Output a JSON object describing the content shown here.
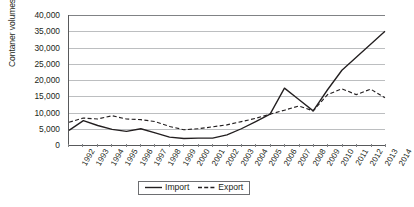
{
  "chart_data": {
    "type": "line",
    "title": "",
    "subtitle": "",
    "xlabel": "",
    "ylabel": "Contaner volumes in TEUs",
    "categories": [
      "1992",
      "1993",
      "1994",
      "1995",
      "1996",
      "1997",
      "1998",
      "1999",
      "2000",
      "2001",
      "2002",
      "2003",
      "2004",
      "2005",
      "2006",
      "2007",
      "2008",
      "2009",
      "2010",
      "2011",
      "2012",
      "2013",
      "2014"
    ],
    "series": [
      {
        "name": "Import",
        "style": "solid",
        "color": "#231f20",
        "values": [
          4500,
          7500,
          6000,
          4800,
          4200,
          5000,
          3700,
          2400,
          2000,
          2100,
          2100,
          3100,
          5000,
          7200,
          9500,
          17500,
          14000,
          10500,
          17000,
          23000,
          27000,
          31000,
          35000
        ]
      },
      {
        "name": "Export",
        "style": "dashed",
        "color": "#231f20",
        "values": [
          7000,
          8300,
          8000,
          9000,
          8000,
          7800,
          7200,
          5700,
          4700,
          5000,
          5600,
          6200,
          7200,
          8200,
          9500,
          10700,
          12000,
          10500,
          15500,
          17300,
          15500,
          17200,
          14500
        ]
      }
    ],
    "ylim": [
      0,
      40000
    ],
    "y_ticks": [
      0,
      5000,
      10000,
      15000,
      20000,
      25000,
      30000,
      35000,
      40000
    ],
    "y_tick_labels": [
      "0",
      "5,000",
      "10,000",
      "15,000",
      "20,000",
      "25,000",
      "30,000",
      "35,000",
      "40,000"
    ],
    "grid": "horizontal",
    "legend_position": "bottom-center",
    "legend_entries": [
      "Import",
      "Export"
    ]
  }
}
